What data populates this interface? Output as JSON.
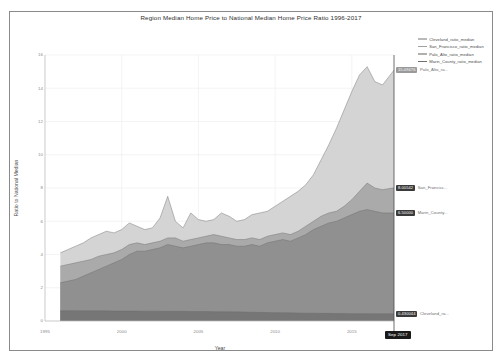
{
  "chart_data": {
    "type": "area",
    "title": "Region Median Home Price to National Median Home Price Ratio 1996-2017",
    "xlabel": "Year",
    "ylabel": "Ratio to National Median",
    "xlim": [
      1995,
      2017.75
    ],
    "ylim": [
      0,
      16
    ],
    "yticks": [
      0,
      2,
      4,
      6,
      8,
      10,
      12,
      14,
      16
    ],
    "ytick_labels": [
      "0",
      "2",
      "4",
      "6",
      "8",
      "10",
      "12",
      "14",
      "16"
    ],
    "xticks": [
      1995,
      2000,
      2005,
      2010,
      2015
    ],
    "xtick_labels": [
      "1995",
      "2000",
      "2005",
      "2010",
      "2015"
    ],
    "grid": true,
    "legend_position": "top-right",
    "stacked": false,
    "x": [
      1996.0,
      1996.5,
      1997.0,
      1997.5,
      1998.0,
      1998.5,
      1999.0,
      1999.5,
      2000.0,
      2000.5,
      2001.0,
      2001.5,
      2002.0,
      2002.5,
      2003.0,
      2003.5,
      2004.0,
      2004.5,
      2005.0,
      2005.5,
      2006.0,
      2006.5,
      2007.0,
      2007.5,
      2008.0,
      2008.5,
      2009.0,
      2009.5,
      2010.0,
      2010.5,
      2011.0,
      2011.5,
      2012.0,
      2012.5,
      2013.0,
      2013.5,
      2014.0,
      2014.5,
      2015.0,
      2015.5,
      2016.0,
      2016.5,
      2017.0,
      2017.75
    ],
    "series": [
      {
        "name": "Palo_Alto_ratio_median",
        "color": "#d2d2d2",
        "end_value": "15.09476",
        "end_label": "Palo_Alto_ra...",
        "values": [
          4.1,
          4.3,
          4.5,
          4.7,
          5.0,
          5.2,
          5.4,
          5.3,
          5.5,
          5.9,
          5.7,
          5.5,
          5.6,
          6.2,
          7.5,
          6.0,
          5.6,
          6.5,
          6.1,
          6.0,
          6.1,
          6.5,
          6.3,
          6.0,
          6.1,
          6.4,
          6.5,
          6.6,
          6.9,
          7.2,
          7.5,
          7.8,
          8.2,
          8.8,
          9.7,
          10.6,
          11.6,
          12.7,
          13.8,
          14.8,
          15.3,
          14.4,
          14.2,
          15.09
        ]
      },
      {
        "name": "San_Francisco_ratio_median",
        "color": "#a8a8a8",
        "end_value": "8.00542",
        "end_label": "San_Francisc...",
        "values": [
          3.3,
          3.4,
          3.5,
          3.6,
          3.7,
          3.9,
          4.0,
          4.1,
          4.3,
          4.6,
          4.7,
          4.6,
          4.7,
          4.8,
          5.0,
          5.0,
          4.8,
          4.9,
          5.0,
          5.1,
          5.2,
          5.1,
          5.0,
          4.9,
          4.9,
          5.0,
          4.9,
          5.1,
          5.2,
          5.3,
          5.2,
          5.4,
          5.7,
          6.0,
          6.3,
          6.5,
          6.6,
          6.9,
          7.3,
          7.8,
          8.3,
          8.0,
          7.9,
          8.01
        ]
      },
      {
        "name": "Marin_County_ratio_median",
        "color": "#8e8e8e",
        "end_value": "6.50000",
        "end_label": "Marin_County...",
        "values": [
          2.3,
          2.4,
          2.5,
          2.7,
          2.9,
          3.1,
          3.3,
          3.5,
          3.7,
          4.0,
          4.2,
          4.2,
          4.3,
          4.4,
          4.6,
          4.5,
          4.4,
          4.5,
          4.6,
          4.7,
          4.7,
          4.6,
          4.6,
          4.5,
          4.5,
          4.6,
          4.5,
          4.7,
          4.8,
          4.9,
          4.8,
          5.0,
          5.2,
          5.5,
          5.7,
          5.9,
          6.0,
          6.2,
          6.4,
          6.6,
          6.7,
          6.6,
          6.5,
          6.5
        ]
      },
      {
        "name": "Cleveland_ratio_median",
        "color": "#757575",
        "end_value": "0.430044",
        "end_label": "Cleveland_ra...",
        "values": [
          0.62,
          0.62,
          0.62,
          0.61,
          0.61,
          0.61,
          0.61,
          0.6,
          0.6,
          0.6,
          0.6,
          0.59,
          0.59,
          0.59,
          0.58,
          0.58,
          0.58,
          0.57,
          0.57,
          0.57,
          0.56,
          0.56,
          0.55,
          0.55,
          0.54,
          0.53,
          0.52,
          0.51,
          0.5,
          0.5,
          0.49,
          0.48,
          0.47,
          0.47,
          0.46,
          0.46,
          0.45,
          0.45,
          0.44,
          0.44,
          0.44,
          0.43,
          0.43,
          0.43
        ]
      }
    ],
    "date_badge": "Sep 2017"
  },
  "legend": {
    "items": [
      {
        "label": "Cleveland_ratio_median",
        "color": "#b9b9b9"
      },
      {
        "label": "San_Francisco_ratio_median",
        "color": "#a0a0a0"
      },
      {
        "label": "Palo_Alto_ratio_median",
        "color": "#b0b0b0"
      },
      {
        "label": "Marin_County_ratio_median",
        "color": "#6f6f6f"
      }
    ]
  }
}
